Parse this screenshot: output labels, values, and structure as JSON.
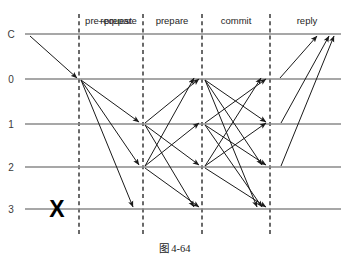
{
  "figure": {
    "caption": "图 4-64",
    "width": 349,
    "height": 264
  },
  "colors": {
    "timeline": "#8a8a8a",
    "divider": "#1a1a1a",
    "arrow": "#1a1a1a",
    "text": "#262626",
    "background": "#ffffff",
    "fault": "#000000"
  },
  "phases": [
    {
      "id": "request",
      "label": "request",
      "label_x": 116,
      "divider_x": 79
    },
    {
      "id": "pre-prepare",
      "label": "pre–prepare",
      "label_x": 111,
      "divider_x": 143
    },
    {
      "id": "prepare",
      "label": "prepare",
      "label_x": 172,
      "divider_x": 202
    },
    {
      "id": "commit",
      "label": "commit",
      "label_x": 236,
      "divider_x": 270
    },
    {
      "id": "reply",
      "label": "reply",
      "label_x": 307,
      "divider_x": null
    }
  ],
  "participants": [
    {
      "id": "C",
      "label": "C",
      "y": 34,
      "role": "client",
      "faulty": false
    },
    {
      "id": "0",
      "label": "0",
      "y": 79,
      "role": "primary",
      "faulty": false
    },
    {
      "id": "1",
      "label": "1",
      "y": 124,
      "role": "replica",
      "faulty": false
    },
    {
      "id": "2",
      "label": "2",
      "y": 167,
      "role": "replica",
      "faulty": false
    },
    {
      "id": "3",
      "label": "3",
      "y": 209,
      "role": "replica",
      "faulty": true
    }
  ],
  "timeline": {
    "x_start": 25,
    "x_end": 341
  },
  "fault_marker": {
    "label": "X",
    "x": 57,
    "y": 209,
    "for_participant": "3"
  },
  "messages": [
    {
      "phase": "request",
      "from": "C",
      "to": "0",
      "x1": 30,
      "y1": 36,
      "x2": 77,
      "y2": 78
    },
    {
      "phase": "pre-prepare",
      "from": "0",
      "to": "1",
      "x1": 81,
      "y1": 80,
      "x2": 139,
      "y2": 122
    },
    {
      "phase": "pre-prepare",
      "from": "0",
      "to": "2",
      "x1": 81,
      "y1": 80,
      "x2": 139,
      "y2": 165
    },
    {
      "phase": "pre-prepare",
      "from": "0",
      "to": "3",
      "x1": 81,
      "y1": 80,
      "x2": 133,
      "y2": 207
    },
    {
      "phase": "prepare",
      "from": "1",
      "to": "0",
      "x1": 145,
      "y1": 123,
      "x2": 199,
      "y2": 79
    },
    {
      "phase": "prepare",
      "from": "1",
      "to": "2",
      "x1": 145,
      "y1": 125,
      "x2": 199,
      "y2": 165
    },
    {
      "phase": "prepare",
      "from": "1",
      "to": "3",
      "x1": 145,
      "y1": 125,
      "x2": 194,
      "y2": 207
    },
    {
      "phase": "prepare",
      "from": "2",
      "to": "0",
      "x1": 145,
      "y1": 166,
      "x2": 194,
      "y2": 78
    },
    {
      "phase": "prepare",
      "from": "2",
      "to": "1",
      "x1": 145,
      "y1": 166,
      "x2": 199,
      "y2": 123
    },
    {
      "phase": "prepare",
      "from": "2",
      "to": "3",
      "x1": 145,
      "y1": 168,
      "x2": 199,
      "y2": 207
    },
    {
      "phase": "commit",
      "from": "0",
      "to": "1",
      "x1": 205,
      "y1": 80,
      "x2": 266,
      "y2": 122
    },
    {
      "phase": "commit",
      "from": "0",
      "to": "2",
      "x1": 205,
      "y1": 80,
      "x2": 262,
      "y2": 165
    },
    {
      "phase": "commit",
      "from": "0",
      "to": "3",
      "x1": 205,
      "y1": 80,
      "x2": 257,
      "y2": 207
    },
    {
      "phase": "commit",
      "from": "1",
      "to": "0",
      "x1": 205,
      "y1": 123,
      "x2": 266,
      "y2": 79
    },
    {
      "phase": "commit",
      "from": "1",
      "to": "2",
      "x1": 205,
      "y1": 125,
      "x2": 266,
      "y2": 165
    },
    {
      "phase": "commit",
      "from": "1",
      "to": "3",
      "x1": 205,
      "y1": 125,
      "x2": 262,
      "y2": 207
    },
    {
      "phase": "commit",
      "from": "2",
      "to": "0",
      "x1": 205,
      "y1": 166,
      "x2": 261,
      "y2": 78
    },
    {
      "phase": "commit",
      "from": "2",
      "to": "1",
      "x1": 205,
      "y1": 166,
      "x2": 266,
      "y2": 123
    },
    {
      "phase": "commit",
      "from": "2",
      "to": "3",
      "x1": 205,
      "y1": 168,
      "x2": 266,
      "y2": 207
    },
    {
      "phase": "reply",
      "from": "0",
      "to": "C",
      "x1": 280,
      "y1": 78,
      "x2": 317,
      "y2": 36
    },
    {
      "phase": "reply",
      "from": "1",
      "to": "C",
      "x1": 281,
      "y1": 123,
      "x2": 329,
      "y2": 36
    },
    {
      "phase": "reply",
      "from": "2",
      "to": "C",
      "x1": 281,
      "y1": 166,
      "x2": 334,
      "y2": 36
    }
  ]
}
